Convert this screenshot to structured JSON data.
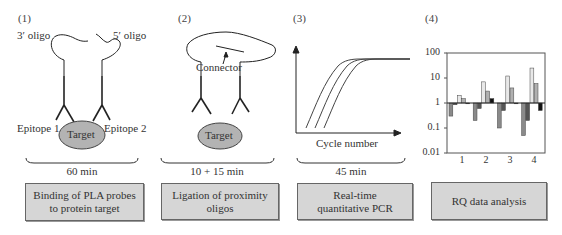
{
  "steps": [
    {
      "number": "(1)",
      "labels": {
        "oligo_left": "3′ oligo",
        "oligo_right": "5′ oligo",
        "epitope_left": "Epitope 1",
        "epitope_right": "Epitope 2",
        "target": "Target"
      },
      "duration": "60 min",
      "box_line1": "Binding of PLA probes",
      "box_line2": "to protein target"
    },
    {
      "number": "(2)",
      "labels": {
        "connector": "Connector",
        "target": "Target"
      },
      "duration": "10 + 15 min",
      "box_line1": "Ligation of proximity",
      "box_line2": "oligos"
    },
    {
      "number": "(3)",
      "labels": {
        "xaxis": "Cycle number"
      },
      "duration": "45 min",
      "box_line1": "Real-time",
      "box_line2": "quantitative PCR"
    },
    {
      "number": "(4)",
      "duration": "",
      "box_line1": "RQ data analysis",
      "box_line2": ""
    }
  ],
  "chart_data": {
    "type": "bar",
    "title": "",
    "xlabel": "",
    "ylabel": "",
    "yscale": "log",
    "ylim": [
      0.01,
      100
    ],
    "yticks": [
      "100",
      "10",
      "1",
      "0.1",
      "0.01"
    ],
    "categories": [
      "1",
      "2",
      "3",
      "4"
    ],
    "baseline": 1,
    "series": [
      {
        "name": "series-a",
        "color": "#8a8a8a",
        "values": [
          0.3,
          0.2,
          0.1,
          0.05
        ]
      },
      {
        "name": "series-b",
        "color": "#555555",
        "values": [
          0.85,
          0.6,
          0.5,
          0.2
        ]
      },
      {
        "name": "series-c",
        "color": "#e8e8e8",
        "values": [
          2,
          7,
          12,
          25
        ]
      },
      {
        "name": "series-d",
        "color": "#b0b0b0",
        "values": [
          1.5,
          3,
          4,
          6
        ]
      },
      {
        "name": "series-e",
        "color": "#111111",
        "values": [
          1,
          1.5,
          0.95,
          0.5
        ]
      }
    ],
    "grid": false,
    "legend": "none"
  },
  "qpcr_curve": {
    "type": "line",
    "description": "Three sigmoidal amplification curves",
    "series_count": 3
  }
}
